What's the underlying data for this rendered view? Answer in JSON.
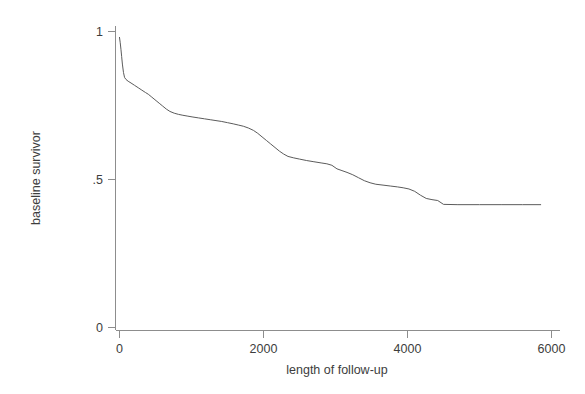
{
  "chart_data": {
    "type": "line",
    "title": "",
    "subtitle": "",
    "xlabel": "length of follow-up",
    "ylabel": "baseline survivor",
    "xlim": [
      0,
      6000
    ],
    "ylim": [
      0,
      1
    ],
    "xticks": [
      0,
      2000,
      4000,
      6000
    ],
    "xtick_labels": [
      "0",
      "2000",
      "4000",
      "6000"
    ],
    "yticks": [
      0,
      0.5,
      1
    ],
    "ytick_labels": [
      "0",
      ".5",
      "1"
    ],
    "grid": false,
    "legend": false,
    "legend_position": "none",
    "line_color": "#5b5b5b",
    "axis_color": "#8d8d8d",
    "background_color": "#ffffff",
    "annotations": [],
    "series": [
      {
        "name": "baseline survivor",
        "x": [
          0,
          10,
          20,
          30,
          40,
          55,
          70,
          90,
          120,
          160,
          210,
          260,
          310,
          360,
          400,
          440,
          480,
          520,
          560,
          600,
          650,
          700,
          760,
          820,
          880,
          950,
          1020,
          1100,
          1180,
          1260,
          1340,
          1420,
          1500,
          1580,
          1650,
          1720,
          1790,
          1860,
          1920,
          1980,
          2040,
          2100,
          2160,
          2220,
          2280,
          2340,
          2420,
          2500,
          2600,
          2700,
          2800,
          2880,
          2950,
          3020,
          3090,
          3160,
          3240,
          3320,
          3400,
          3480,
          3560,
          3660,
          3760,
          3860,
          3940,
          4020,
          4100,
          4180,
          4260,
          4340,
          4420,
          4500,
          4700,
          5000,
          5300,
          5600,
          5850
        ],
        "y": [
          0.98,
          0.962,
          0.94,
          0.915,
          0.89,
          0.862,
          0.845,
          0.838,
          0.832,
          0.826,
          0.818,
          0.81,
          0.802,
          0.794,
          0.788,
          0.78,
          0.772,
          0.764,
          0.756,
          0.748,
          0.738,
          0.73,
          0.724,
          0.72,
          0.717,
          0.714,
          0.711,
          0.708,
          0.705,
          0.702,
          0.699,
          0.696,
          0.692,
          0.688,
          0.684,
          0.68,
          0.674,
          0.666,
          0.656,
          0.644,
          0.632,
          0.62,
          0.608,
          0.596,
          0.586,
          0.578,
          0.573,
          0.569,
          0.564,
          0.56,
          0.556,
          0.553,
          0.548,
          0.536,
          0.53,
          0.524,
          0.516,
          0.506,
          0.496,
          0.489,
          0.484,
          0.481,
          0.478,
          0.475,
          0.472,
          0.468,
          0.46,
          0.447,
          0.436,
          0.432,
          0.429,
          0.416,
          0.415,
          0.415,
          0.415,
          0.415,
          0.415
        ]
      }
    ]
  },
  "axes": {
    "x_axis_label": "length of follow-up",
    "y_axis_label": "baseline survivor"
  }
}
